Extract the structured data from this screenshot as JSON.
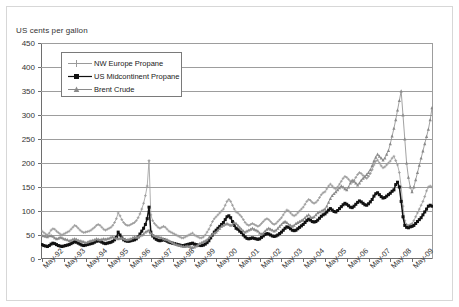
{
  "chart_data": {
    "type": "line",
    "title": "US cents per gallon",
    "xlabel": "",
    "ylabel": "US cents per gallon",
    "ylim": [
      0,
      450
    ],
    "ytick_step": 50,
    "yticks": [
      0,
      50,
      100,
      150,
      200,
      250,
      300,
      350,
      400,
      450
    ],
    "grid": true,
    "legend_position": "upper-left-inside",
    "x_start": "May-92",
    "x_end": "May-09",
    "x_interval": "monthly",
    "xticks": [
      "May-92",
      "May-93",
      "May-94",
      "May-95",
      "May-96",
      "May-97",
      "May-98",
      "May-99",
      "May-00",
      "May-01",
      "May-02",
      "May-03",
      "May-04",
      "May-05",
      "May-06",
      "May-07",
      "May-08",
      "May-09"
    ],
    "series": [
      {
        "name": "NW Europe Propane",
        "marker": "plus",
        "color": "#9a9a9a",
        "values": [
          58,
          55,
          52,
          50,
          54,
          60,
          63,
          62,
          58,
          55,
          52,
          50,
          52,
          54,
          56,
          58,
          62,
          66,
          70,
          68,
          64,
          60,
          57,
          55,
          56,
          57,
          58,
          60,
          63,
          66,
          70,
          72,
          70,
          66,
          62,
          60,
          62,
          64,
          66,
          70,
          76,
          84,
          96,
          90,
          82,
          76,
          72,
          70,
          70,
          72,
          74,
          76,
          80,
          86,
          94,
          104,
          116,
          132,
          152,
          205,
          92,
          80,
          74,
          70,
          66,
          64,
          66,
          68,
          66,
          62,
          58,
          56,
          54,
          52,
          50,
          48,
          46,
          44,
          44,
          46,
          48,
          50,
          52,
          54,
          50,
          48,
          46,
          44,
          44,
          46,
          50,
          56,
          62,
          70,
          78,
          84,
          88,
          92,
          96,
          100,
          104,
          112,
          120,
          124,
          120,
          112,
          104,
          98,
          96,
          92,
          88,
          82,
          76,
          72,
          70,
          72,
          74,
          72,
          70,
          68,
          70,
          74,
          78,
          82,
          84,
          82,
          78,
          74,
          72,
          74,
          78,
          82,
          86,
          92,
          98,
          102,
          100,
          96,
          92,
          90,
          92,
          96,
          100,
          104,
          108,
          114,
          120,
          124,
          122,
          118,
          116,
          118,
          122,
          128,
          134,
          138,
          140,
          146,
          152,
          156,
          152,
          148,
          146,
          150,
          156,
          162,
          168,
          172,
          170,
          166,
          162,
          160,
          164,
          170,
          176,
          180,
          178,
          174,
          170,
          168,
          172,
          178,
          186,
          196,
          204,
          206,
          200,
          194,
          190,
          192,
          196,
          200,
          204,
          210,
          214,
          205,
          196,
          180,
          150,
          110,
          80,
          72,
          70,
          72,
          74,
          80,
          88,
          96,
          104,
          112,
          120,
          130,
          142,
          150,
          152,
          150
        ]
      },
      {
        "name": "US Midcontinent Propane",
        "marker": "square",
        "color": "#111111",
        "values": [
          30,
          28,
          27,
          26,
          28,
          31,
          33,
          32,
          30,
          28,
          27,
          26,
          27,
          28,
          29,
          30,
          32,
          34,
          36,
          35,
          33,
          31,
          29,
          28,
          29,
          30,
          31,
          32,
          33,
          35,
          37,
          38,
          37,
          35,
          33,
          32,
          33,
          34,
          35,
          37,
          40,
          45,
          56,
          50,
          44,
          40,
          38,
          37,
          37,
          38,
          39,
          40,
          42,
          46,
          52,
          58,
          64,
          72,
          84,
          108,
          56,
          48,
          44,
          41,
          39,
          38,
          39,
          40,
          39,
          37,
          35,
          34,
          33,
          32,
          31,
          30,
          29,
          28,
          28,
          29,
          30,
          31,
          32,
          33,
          31,
          30,
          29,
          28,
          28,
          29,
          31,
          34,
          38,
          44,
          50,
          56,
          60,
          64,
          68,
          72,
          76,
          82,
          88,
          90,
          86,
          78,
          70,
          64,
          62,
          58,
          55,
          50,
          46,
          43,
          42,
          43,
          44,
          43,
          42,
          41,
          42,
          45,
          48,
          51,
          53,
          52,
          50,
          48,
          47,
          48,
          50,
          53,
          56,
          60,
          64,
          67,
          66,
          63,
          60,
          59,
          60,
          63,
          66,
          69,
          72,
          76,
          80,
          83,
          81,
          78,
          77,
          78,
          81,
          85,
          89,
          92,
          94,
          98,
          102,
          105,
          102,
          99,
          98,
          101,
          105,
          109,
          113,
          116,
          114,
          111,
          108,
          107,
          110,
          114,
          118,
          121,
          119,
          116,
          113,
          112,
          115,
          119,
          124,
          131,
          136,
          138,
          134,
          130,
          127,
          128,
          131,
          134,
          137,
          141,
          144,
          155,
          160,
          150,
          120,
          88,
          70,
          66,
          65,
          67,
          68,
          70,
          74,
          78,
          82,
          86,
          92,
          98,
          104,
          110,
          112,
          110
        ]
      },
      {
        "name": "Brent Crude",
        "marker": "triangle",
        "color": "#8a8a8a",
        "values": [
          49,
          48,
          47,
          46,
          48,
          49,
          47,
          44,
          42,
          43,
          45,
          44,
          42,
          41,
          40,
          38,
          39,
          41,
          42,
          41,
          39,
          38,
          37,
          36,
          34,
          35,
          37,
          38,
          39,
          40,
          42,
          41,
          40,
          41,
          42,
          41,
          42,
          43,
          45,
          46,
          44,
          43,
          42,
          43,
          44,
          42,
          41,
          40,
          41,
          42,
          44,
          46,
          45,
          46,
          48,
          50,
          52,
          56,
          58,
          60,
          54,
          50,
          48,
          47,
          46,
          45,
          44,
          42,
          41,
          40,
          38,
          36,
          34,
          32,
          30,
          29,
          28,
          27,
          26,
          26,
          27,
          26,
          25,
          24,
          25,
          27,
          29,
          32,
          34,
          36,
          38,
          40,
          44,
          48,
          52,
          54,
          56,
          60,
          64,
          68,
          70,
          72,
          74,
          72,
          70,
          72,
          76,
          74,
          70,
          66,
          62,
          58,
          56,
          58,
          60,
          62,
          64,
          62,
          60,
          58,
          54,
          52,
          54,
          58,
          62,
          64,
          62,
          60,
          58,
          60,
          64,
          68,
          72,
          76,
          78,
          76,
          72,
          70,
          68,
          70,
          74,
          76,
          78,
          80,
          82,
          86,
          90,
          92,
          88,
          86,
          88,
          92,
          96,
          98,
          100,
          102,
          104,
          110,
          118,
          126,
          132,
          136,
          140,
          144,
          148,
          152,
          150,
          146,
          144,
          150,
          158,
          164,
          162,
          158,
          154,
          158,
          164,
          168,
          172,
          176,
          180,
          186,
          194,
          204,
          212,
          218,
          214,
          210,
          206,
          210,
          218,
          226,
          240,
          256,
          272,
          290,
          310,
          330,
          350,
          300,
          250,
          200,
          170,
          150,
          140,
          150,
          165,
          180,
          195,
          210,
          225,
          240,
          255,
          270,
          290,
          315
        ]
      }
    ]
  },
  "legend": {
    "items": [
      {
        "label": "NW Europe Propane"
      },
      {
        "label": "US Midcontinent Propane"
      },
      {
        "label": "Brent Crude"
      }
    ]
  }
}
